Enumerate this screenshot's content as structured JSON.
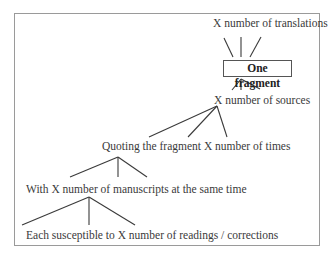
{
  "diagram": {
    "type": "tree",
    "nodes": {
      "translations": "X number of translations",
      "fragment": "One fragment",
      "sources": "X number of sources",
      "quoting": "Quoting the fragment X number of times",
      "manuscripts": "With X number of manuscripts at the same time",
      "readings": "Each susceptible to X number of readings / corrections"
    },
    "edges": [
      {
        "from": "fragment",
        "to": "translations"
      },
      {
        "from": "fragment",
        "to": "sources"
      },
      {
        "from": "sources",
        "to": "quoting"
      },
      {
        "from": "quoting",
        "to": "manuscripts"
      },
      {
        "from": "manuscripts",
        "to": "readings"
      }
    ],
    "colors": {
      "line": "#3a3a3a",
      "border": "#9a9a9a",
      "text": "#3a3a3a"
    }
  }
}
